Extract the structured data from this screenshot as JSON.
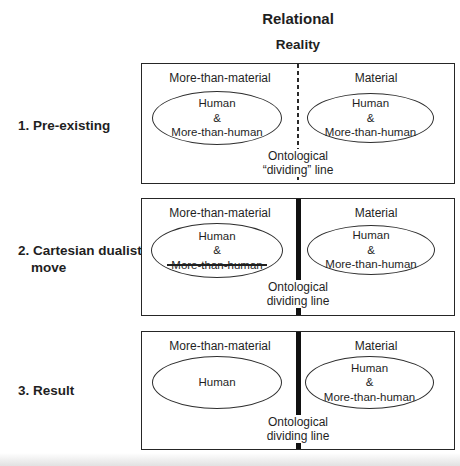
{
  "title": {
    "line1": "Relational",
    "line2": "Reality"
  },
  "stages": [
    {
      "line1": "1. Pre-existing",
      "line2": ""
    },
    {
      "line1": "2. Cartesian dualist",
      "line2": "move"
    },
    {
      "line1": "3. Result",
      "line2": ""
    }
  ],
  "panels": [
    {
      "left_header": "More-than-material",
      "right_header": "Material",
      "left_ellipse": {
        "line1": "Human",
        "line2": "&",
        "line3": "More-than-human"
      },
      "right_ellipse": {
        "line1": "Human",
        "line2": "&",
        "line3": "More-than-human"
      },
      "divider_label": {
        "line1": "Ontological",
        "line2": "“dividing” line"
      },
      "divider_style": "dashed"
    },
    {
      "left_header": "More-than-material",
      "right_header": "Material",
      "left_ellipse": {
        "line1": "Human",
        "line2": "&",
        "line3": "More-than-human",
        "line3_struck": true
      },
      "right_ellipse": {
        "line1": "Human",
        "line2": "&",
        "line3": "More-than-human"
      },
      "divider_label": {
        "line1": "Ontological",
        "line2": "dividing line"
      },
      "divider_style": "solid"
    },
    {
      "left_header": "More-than-material",
      "right_header": "Material",
      "left_ellipse": {
        "line1": "Human"
      },
      "right_ellipse": {
        "line1": "Human",
        "line2": "&",
        "line3": "More-than-human"
      },
      "divider_label": {
        "line1": "Ontological",
        "line2": "dividing line"
      },
      "divider_style": "solid"
    }
  ],
  "colors": {
    "ink": "#1f1f1f",
    "background": "#ffffff",
    "divider": "#111111"
  }
}
